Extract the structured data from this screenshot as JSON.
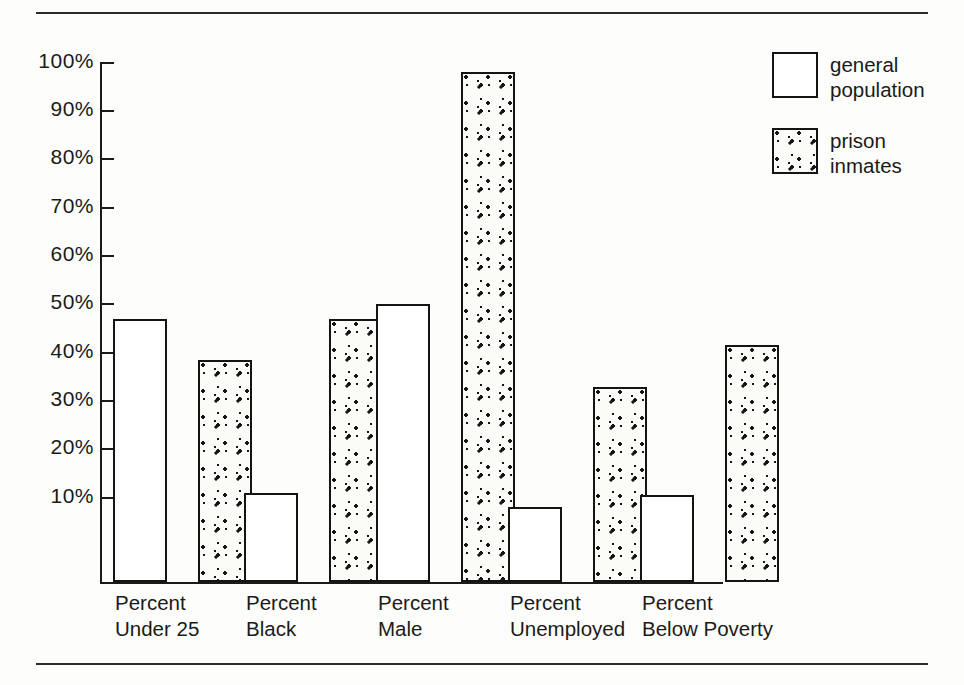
{
  "figure": {
    "has_top_rule": true,
    "has_bottom_rule": true,
    "background_color": "#fdfdfb",
    "ink_color": "#1a1a1a"
  },
  "axis": {
    "y_ticks": [
      "100%",
      "90%",
      "80%",
      "70%",
      "60%",
      "50%",
      "40%",
      "30%",
      "20%",
      "10%"
    ]
  },
  "legend": {
    "entries": [
      {
        "label": "general\npopulation",
        "style": "open",
        "swatch_name": "legend-swatch-general-population"
      },
      {
        "label": "prison\ninmates",
        "style": "stipple",
        "swatch_name": "legend-swatch-prison-inmates"
      }
    ]
  },
  "groups": [
    {
      "label": "Percent\nUnder 25"
    },
    {
      "label": "Percent\nBlack"
    },
    {
      "label": "Percent\nMale"
    },
    {
      "label": "Percent\nUnemployed"
    },
    {
      "label": "Percent\nBelow Poverty"
    }
  ],
  "chart_data": {
    "type": "bar",
    "title": "",
    "subtitle": "",
    "xlabel": "",
    "ylabel": "",
    "ylim": [
      0,
      100
    ],
    "yticks": [
      10,
      20,
      30,
      40,
      50,
      60,
      70,
      80,
      90,
      100
    ],
    "ytick_labels": [
      "10%",
      "20%",
      "30%",
      "40%",
      "50%",
      "60%",
      "70%",
      "80%",
      "90%",
      "100%"
    ],
    "grid": false,
    "legend_position": "top-right",
    "categories": [
      "Percent Under 25",
      "Percent Black",
      "Percent Male",
      "Percent Unemployed",
      "Percent Below Poverty"
    ],
    "series": [
      {
        "name": "general population",
        "fill": "open",
        "values": [
          47,
          11,
          50,
          8,
          10.5
        ]
      },
      {
        "name": "prison inmates",
        "fill": "stipple",
        "values": [
          38.5,
          47,
          98,
          33,
          41.5
        ]
      }
    ]
  }
}
